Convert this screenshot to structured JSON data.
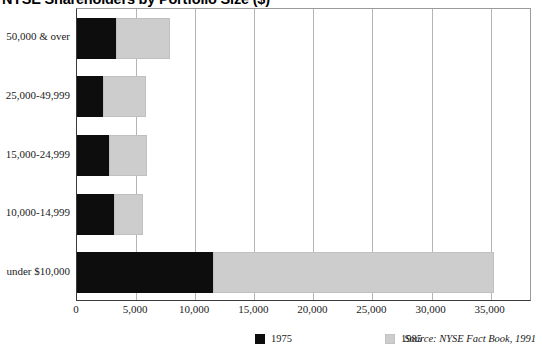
{
  "chart_data": {
    "type": "bar",
    "orientation": "horizontal",
    "stacked": true,
    "title": "NYSE Shareholders by Portfolio Size ($)",
    "xlabel": "",
    "ylabel": "",
    "xlim": [
      0,
      38500
    ],
    "ylim": null,
    "grid": true,
    "legend_position": "bottom-center",
    "categories": [
      "under $10,000",
      "10,000-14,999",
      "15,000-24,999",
      "25,000-49,999",
      "50,000 & over"
    ],
    "xticks": [
      0,
      5000,
      10000,
      15000,
      20000,
      25000,
      30000,
      35000
    ],
    "xticklabels": [
      "0",
      "5,000",
      "10,000",
      "15,000",
      "20,000",
      "25,000",
      "30,000",
      "35,000"
    ],
    "series": [
      {
        "name": "1975",
        "color": "#0d0d0d",
        "values": [
          11500,
          3100,
          2700,
          2200,
          3300
        ]
      },
      {
        "name": "1985",
        "color": "#cdcdcd",
        "values": [
          23800,
          2500,
          3200,
          3600,
          4600
        ]
      }
    ],
    "source": "Source: NYSE Fact Book, 1991"
  },
  "legend": {
    "items": [
      {
        "label": "1975",
        "swatch": "black-square-swatch"
      },
      {
        "label": "1985",
        "swatch": "gray-square-swatch"
      }
    ]
  },
  "colors": {
    "series_1975": "#0d0d0d",
    "series_1985": "#cdcdcd",
    "axis": "#3a3a3a",
    "gridline": "#b4b4b4",
    "text": "#1a1a1a",
    "background": "#ffffff"
  }
}
